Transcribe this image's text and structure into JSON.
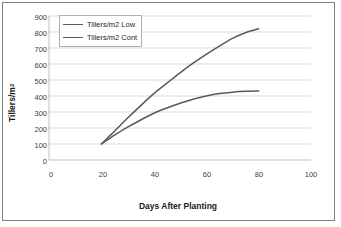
{
  "chart_data": {
    "type": "line",
    "title": "",
    "xlabel": "Days After Planting",
    "ylabel": "Tillers/m²",
    "xlim": [
      0,
      100
    ],
    "ylim": [
      0,
      900
    ],
    "xticks": [
      "0",
      "20",
      "40",
      "60",
      "80",
      "100"
    ],
    "yticks": [
      "0",
      "100",
      "200",
      "300",
      "400",
      "500",
      "600",
      "700",
      "800",
      "900"
    ],
    "grid": "horizontal",
    "legend_position": "top-left-inside",
    "series": [
      {
        "name": "Tillers/m2 Low",
        "color": "#595959",
        "x": [
          20,
          25,
          30,
          35,
          40,
          45,
          50,
          55,
          60,
          65,
          70,
          75,
          80
        ],
        "values": [
          100,
          155,
          205,
          250,
          292,
          325,
          355,
          380,
          400,
          415,
          424,
          429,
          431
        ]
      },
      {
        "name": "Tillers/m2 Cont",
        "color": "#595959",
        "x": [
          20,
          25,
          30,
          35,
          40,
          45,
          50,
          55,
          60,
          65,
          70,
          75,
          80
        ],
        "values": [
          100,
          180,
          262,
          340,
          415,
          480,
          545,
          605,
          660,
          712,
          760,
          795,
          820
        ]
      }
    ]
  },
  "legend": {
    "items": [
      {
        "label": "Tillers/m2 Low"
      },
      {
        "label": "Tillers/m2 Cont"
      }
    ]
  },
  "axes": {
    "y_title_main": "Tillers/m",
    "y_title_sup": "2",
    "x_title": "Days After Planting"
  },
  "colors": {
    "line": "#595959",
    "grid": "#d9d9d9",
    "axis": "#bfbfbf",
    "frame": "#808080",
    "text": "#404040"
  }
}
